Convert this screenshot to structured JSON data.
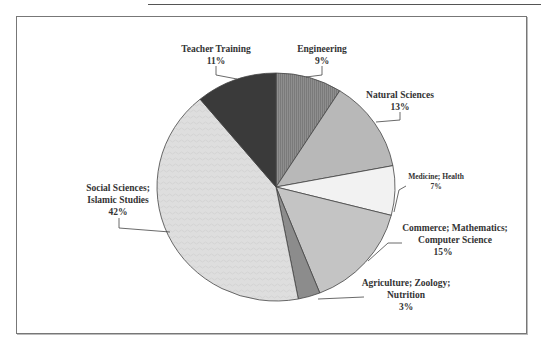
{
  "chart_data": {
    "type": "pie",
    "title": "",
    "start_angle_deg": 0,
    "direction": "clockwise",
    "slices": [
      {
        "label": "Engineering",
        "value": 9,
        "pct_label": "9%",
        "color": "#8a8a8a",
        "pattern": "vertical-lines"
      },
      {
        "label": "Natural Sciences",
        "value": 13,
        "pct_label": "13%",
        "color": "#b8b8b8",
        "pattern": "none"
      },
      {
        "label": "Medicine; Health",
        "value": 7,
        "pct_label": "7%",
        "color": "#f2f2f2",
        "pattern": "none"
      },
      {
        "label": "Commerce; Mathematics; Computer Science",
        "value": 15,
        "pct_label": "15%",
        "color": "#c4c4c4",
        "pattern": "none"
      },
      {
        "label": "Agriculture; Zoology; Nutrition",
        "value": 3,
        "pct_label": "3%",
        "color": "#8c8c8c",
        "pattern": "none"
      },
      {
        "label": "Social Sciences; Islamic Studies",
        "value": 42,
        "pct_label": "42%",
        "color": "#dcdcdc",
        "pattern": "wavy"
      },
      {
        "label": "Teacher Training",
        "value": 11,
        "pct_label": "11%",
        "color": "#3a3a3a",
        "pattern": "none"
      }
    ],
    "legend": "none (callout labels)",
    "units": "percent"
  },
  "labels": {
    "teacher_training": {
      "line1": "Teacher Training",
      "pct": "11%"
    },
    "engineering": {
      "line1": "Engineering",
      "pct": "9%"
    },
    "natural_sciences": {
      "line1": "Natural Sciences",
      "pct": "13%"
    },
    "medicine": {
      "line1": "Medicine; Health",
      "pct": "7%"
    },
    "commerce": {
      "line1": "Commerce; Mathematics;",
      "line2": "Computer Science",
      "pct": "15%"
    },
    "agriculture": {
      "line1": "Agriculture; Zoology;",
      "line2": "Nutrition",
      "pct": "3%"
    },
    "social": {
      "line1": "Social Sciences;",
      "line2": "Islamic Studies",
      "pct": "42%"
    }
  }
}
